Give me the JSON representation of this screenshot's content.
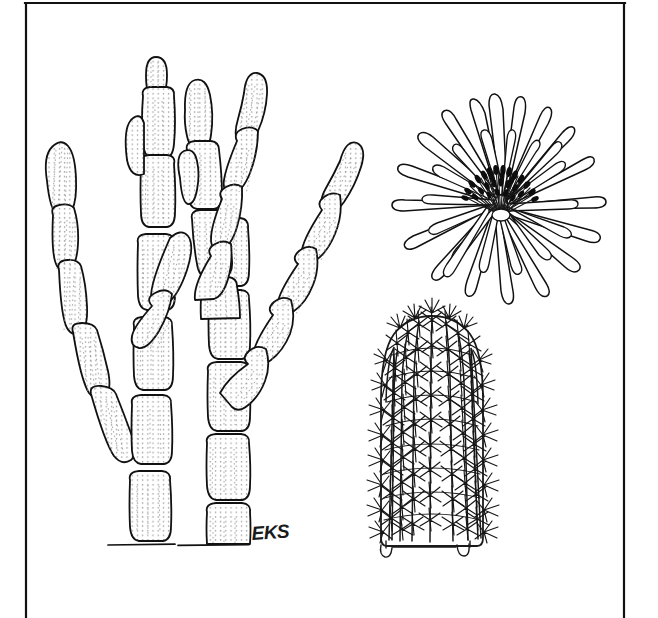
{
  "figure": {
    "kind": "botanical-line-illustration",
    "medium": "pen-and-ink stipple drawing",
    "background_color": "#ffffff",
    "ink_color": "#111111",
    "signature": "EKS",
    "border": {
      "present": true,
      "style": "three-sided rule (left, top, right); open at bottom",
      "color": "#111111",
      "left_x": 26,
      "right_x": 624,
      "top_y": 3,
      "stroke_width": 2.2
    },
    "panels": [
      {
        "id": "habit",
        "name": "jointed-stem-habit",
        "label": "Segmented jointed cactus stems (habit)",
        "position": "left",
        "description": "Clump of erect, cylindrical, segmented cactus stems rising from a ground line; two main trunks with several ascending branches, each stem built of elongate oval joints with finely stippled vertical ribbing.",
        "ground_line": {
          "y": 545,
          "x_start": 108,
          "x_end": 248
        },
        "trunks": 2,
        "branch_count": 6
      },
      {
        "id": "flower",
        "name": "flower-detail",
        "label": "Flower, face view",
        "position": "upper-right",
        "description": "Radially symmetric daisy-like flower with many narrow strap-shaped petals in two ranks and a dense boss of dark-tipped stamens at the center.",
        "petal_count": 34,
        "center": {
          "cx": 501,
          "cy": 202,
          "r": 18
        }
      },
      {
        "id": "stem-detail",
        "name": "ribbed-spiny-stem-detail",
        "label": "Ribbed stem with areoles and spines",
        "position": "lower-right",
        "description": "Short columnar cactus stem in side view showing about eight vertical ribs, each bearing regularly spaced areoles with radiating clusters of stiff spines; rounded apex and a short rooted base.",
        "rib_count": 8,
        "areoles_per_rib": 13
      }
    ]
  }
}
